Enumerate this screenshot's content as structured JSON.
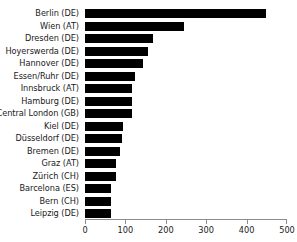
{
  "chart_data": {
    "type": "bar",
    "orientation": "horizontal",
    "title": "",
    "xlabel": "",
    "ylabel": "",
    "xlim": [
      0,
      500
    ],
    "xticks": [
      0,
      100,
      200,
      300,
      400,
      500
    ],
    "xtick_labels": [
      "0",
      "100",
      "200",
      "300",
      "400",
      "500"
    ],
    "grid": false,
    "legend": null,
    "bar_color": "#000000",
    "background_color": "#ffffff",
    "axis_color": "#8c8c8c",
    "categories": [
      "Berlin (DE)",
      "Wien (AT)",
      "Dresden (DE)",
      "Hoyerswerda (DE)",
      "Hannover (DE)",
      "Essen/Ruhr (DE)",
      "Innsbruck (AT)",
      "Hamburg (DE)",
      "Central London (GB)",
      "Kiel (DE)",
      "Düsseldorf (DE)",
      "Bremen (DE)",
      "Graz (AT)",
      "Zürich (CH)",
      "Barcelona (ES)",
      "Bern (CH)",
      "Leipzig (DE)"
    ],
    "values": [
      448,
      245,
      168,
      156,
      144,
      124,
      117,
      116,
      116,
      93,
      92,
      87,
      77,
      76,
      65,
      64,
      64
    ]
  }
}
